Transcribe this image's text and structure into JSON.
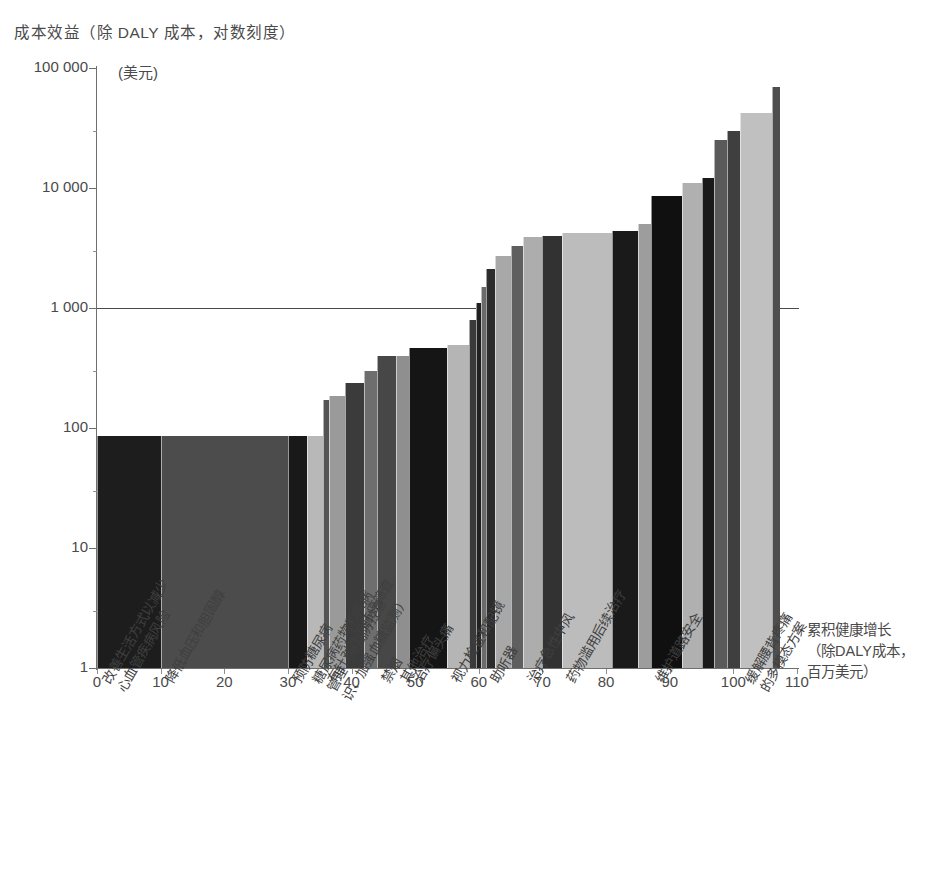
{
  "title": "成本效益（除 DALY 成本，对数刻度）",
  "yaxis": {
    "unit": "(美元)",
    "ticks": [
      "100 000",
      "10 000",
      "1 000",
      "100",
      "10",
      "1"
    ],
    "values": [
      100000,
      10000,
      1000,
      100,
      10,
      1
    ]
  },
  "xaxis": {
    "title": "累积健康增长\n（除DALY成本，\n百万美元）",
    "ticks": [
      "0",
      "10",
      "20",
      "30",
      "40",
      "50",
      "60",
      "70",
      "80",
      "90",
      "100",
      "110"
    ],
    "values": [
      0,
      10,
      20,
      30,
      40,
      50,
      60,
      70,
      80,
      90,
      100,
      110
    ]
  },
  "reference_line_value": 1000,
  "chart_data": {
    "type": "bar",
    "title": "成本效益（除 DALY 成本，对数刻度）",
    "subtitle": "",
    "xlabel": "累积健康增长（除DALY成本，百万美元）",
    "ylabel": "成本效益（除 DALY 成本，对数刻度）(美元)",
    "ylim": [
      1,
      100000
    ],
    "xlim": [
      0,
      110
    ],
    "yscale": "log",
    "grid": false,
    "legend": "none",
    "annotations": [
      "1 000 美元参考线"
    ],
    "axis_note": "条形宽度代表累积健康增长（百万美元），高度代表每单位成本效益（美元）",
    "categories": [
      "改善生活方式以减少\n心血管疾病风险",
      "降低血压和胆固醇",
      "预防糖尿病",
      "糖尿病药物和疾病\n管理（提高防控意\n识、加强血糖监测）",
      "有针对性的肺癌筛查",
      "禁烟",
      "其他治疗",
      "治疗偏头痛",
      "视力检查和配镜",
      "助听器",
      "治疗急性中风",
      "药物滥用后续治疗",
      "维护道路安全",
      "缓解腰背疼痛\n的多模态方案"
    ],
    "bars": [
      {
        "label": "改善生活方式以减少心血管疾病风险",
        "x_start": 0,
        "x_end": 10,
        "width": 10,
        "value": 85,
        "shade": "#1d1d1d"
      },
      {
        "label": "降低血压和胆固醇",
        "x_start": 10,
        "x_end": 30,
        "width": 20,
        "value": 85,
        "shade": "#4c4c4c"
      },
      {
        "label": "预防糖尿病",
        "x_start": 30,
        "x_end": 33,
        "width": 3,
        "value": 85,
        "shade": "#191919"
      },
      {
        "label": "糖尿病药物和疾病管理",
        "x_start": 33,
        "x_end": 35.5,
        "width": 2.5,
        "value": 85,
        "shade": "#b8b8b8"
      },
      {
        "label": "有针对性的肺癌筛查",
        "x_start": 35.5,
        "x_end": 36.5,
        "width": 1,
        "value": 170,
        "shade": "#545454"
      },
      {
        "label": "未标注项",
        "x_start": 36.5,
        "x_end": 39,
        "width": 2.5,
        "value": 185,
        "shade": "#9a9a9a"
      },
      {
        "label": "未标注项",
        "x_start": 39,
        "x_end": 42,
        "width": 3,
        "value": 235,
        "shade": "#3b3b3b"
      },
      {
        "label": "未标注项",
        "x_start": 42,
        "x_end": 44,
        "width": 2,
        "value": 300,
        "shade": "#6e6e6e"
      },
      {
        "label": "禁烟",
        "x_start": 44,
        "x_end": 47,
        "width": 3,
        "value": 400,
        "shade": "#474747"
      },
      {
        "label": "其他治疗",
        "x_start": 47,
        "x_end": 49,
        "width": 2,
        "value": 400,
        "shade": "#8f8f8f"
      },
      {
        "label": "治疗偏头痛",
        "x_start": 49,
        "x_end": 55,
        "width": 6,
        "value": 460,
        "shade": "#151515"
      },
      {
        "label": "视力检查和配镜",
        "x_start": 55,
        "x_end": 58.5,
        "width": 3.5,
        "value": 490,
        "shade": "#b5b5b5"
      },
      {
        "label": "未标注项",
        "x_start": 58.5,
        "x_end": 59.5,
        "width": 1,
        "value": 800,
        "shade": "#3a3a3a"
      },
      {
        "label": "未标注项",
        "x_start": 59.5,
        "x_end": 60.3,
        "width": 0.8,
        "value": 1100,
        "shade": "#202020"
      },
      {
        "label": "未标注项",
        "x_start": 60.3,
        "x_end": 61.2,
        "width": 0.9,
        "value": 1500,
        "shade": "#6b6b6b"
      },
      {
        "label": "助听器",
        "x_start": 61.2,
        "x_end": 62.5,
        "width": 1.3,
        "value": 2100,
        "shade": "#2c2c2c"
      },
      {
        "label": "未标注项",
        "x_start": 62.5,
        "x_end": 65,
        "width": 2.5,
        "value": 2700,
        "shade": "#a8a8a8"
      },
      {
        "label": "未标注项",
        "x_start": 65,
        "x_end": 67,
        "width": 2,
        "value": 3300,
        "shade": "#5f5f5f"
      },
      {
        "label": "治疗急性中风",
        "x_start": 67,
        "x_end": 70,
        "width": 3,
        "value": 3900,
        "shade": "#adadad"
      },
      {
        "label": "未标注项",
        "x_start": 70,
        "x_end": 73,
        "width": 3,
        "value": 4000,
        "shade": "#323232"
      },
      {
        "label": "药物滥用后续治疗",
        "x_start": 73,
        "x_end": 81,
        "width": 8,
        "value": 4200,
        "shade": "#bcbcbc"
      },
      {
        "label": "未标注项",
        "x_start": 81,
        "x_end": 85,
        "width": 4,
        "value": 4400,
        "shade": "#1a1a1a"
      },
      {
        "label": "未标注项",
        "x_start": 85,
        "x_end": 87,
        "width": 2,
        "value": 5000,
        "shade": "#9d9d9d"
      },
      {
        "label": "维护道路安全",
        "x_start": 87,
        "x_end": 92,
        "width": 5,
        "value": 8500,
        "shade": "#101010"
      },
      {
        "label": "未标注项",
        "x_start": 92,
        "x_end": 95,
        "width": 3,
        "value": 11000,
        "shade": "#b0b0b0"
      },
      {
        "label": "未标注项",
        "x_start": 95,
        "x_end": 97,
        "width": 2,
        "value": 12000,
        "shade": "#191919"
      },
      {
        "label": "未标注项",
        "x_start": 97,
        "x_end": 99,
        "width": 2,
        "value": 25000,
        "shade": "#5a5a5a"
      },
      {
        "label": "未标注项",
        "x_start": 99,
        "x_end": 101,
        "width": 2,
        "value": 30000,
        "shade": "#3f3f3f"
      },
      {
        "label": "缓解腰背疼痛的多模态方案",
        "x_start": 101,
        "x_end": 106,
        "width": 5,
        "value": 42000,
        "shade": "#c0c0c0"
      },
      {
        "label": "未标注项",
        "x_start": 106,
        "x_end": 107.3,
        "width": 1.3,
        "value": 70000,
        "shade": "#4e4e4e"
      }
    ],
    "category_label_positions": [
      0,
      10,
      30,
      33,
      35.5,
      44,
      47,
      49,
      55,
      61.2,
      67,
      73,
      87,
      101
    ]
  },
  "colors": {
    "axis": "#6f6f6f",
    "text": "#4a4a4a",
    "reference_line": "#4a4a4a",
    "background": "#ffffff"
  }
}
